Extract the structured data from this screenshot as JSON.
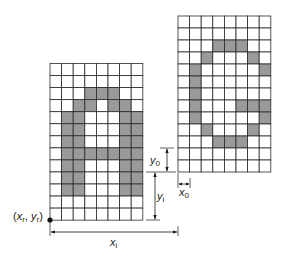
{
  "grid_a": {
    "name": "letter-A-glyph",
    "origin": [
      50,
      63.5
    ],
    "cols": 8,
    "rows": 13,
    "cell_w": 11.6,
    "cell_h": 12.05,
    "filled": [
      [
        2,
        3
      ],
      [
        2,
        4
      ],
      [
        2,
        5
      ],
      [
        3,
        2
      ],
      [
        3,
        3
      ],
      [
        3,
        5
      ],
      [
        3,
        6
      ],
      [
        4,
        1
      ],
      [
        4,
        2
      ],
      [
        4,
        6
      ],
      [
        4,
        7
      ],
      [
        5,
        1
      ],
      [
        5,
        2
      ],
      [
        5,
        6
      ],
      [
        5,
        7
      ],
      [
        6,
        1
      ],
      [
        6,
        2
      ],
      [
        6,
        6
      ],
      [
        6,
        7
      ],
      [
        7,
        1
      ],
      [
        7,
        2
      ],
      [
        7,
        3
      ],
      [
        7,
        4
      ],
      [
        7,
        5
      ],
      [
        7,
        6
      ],
      [
        7,
        7
      ],
      [
        8,
        1
      ],
      [
        8,
        2
      ],
      [
        8,
        6
      ],
      [
        8,
        7
      ],
      [
        9,
        1
      ],
      [
        9,
        2
      ],
      [
        9,
        6
      ],
      [
        9,
        7
      ],
      [
        10,
        1
      ],
      [
        10,
        2
      ],
      [
        10,
        6
      ],
      [
        10,
        7
      ]
    ]
  },
  "grid_g": {
    "name": "letter-G-glyph",
    "origin": [
      178,
      16
    ],
    "cols": 8,
    "rows": 13,
    "cell_w": 11.6,
    "cell_h": 12.0,
    "filled": [
      [
        2,
        3
      ],
      [
        2,
        4
      ],
      [
        2,
        5
      ],
      [
        3,
        2
      ],
      [
        3,
        6
      ],
      [
        4,
        1
      ],
      [
        4,
        7
      ],
      [
        5,
        1
      ],
      [
        6,
        1
      ],
      [
        7,
        1
      ],
      [
        7,
        5
      ],
      [
        7,
        6
      ],
      [
        7,
        7
      ],
      [
        8,
        1
      ],
      [
        8,
        7
      ],
      [
        9,
        2
      ],
      [
        9,
        6
      ],
      [
        10,
        3
      ],
      [
        10,
        4
      ],
      [
        10,
        5
      ]
    ]
  },
  "labels": {
    "reference_point": {
      "x": "x",
      "x_sub": "r",
      "sep": ", ",
      "y": "y",
      "y_sub": "r"
    },
    "y0": {
      "main": "y",
      "sub": "0"
    },
    "x0": {
      "main": "x",
      "sub": "0"
    },
    "yi": {
      "main": "y",
      "sub": "i"
    },
    "xi": {
      "main": "x",
      "sub": "i"
    }
  },
  "colors": {
    "filled_cell": "#9a9a9a",
    "grid_line": "#2a2a2a",
    "background": "#ffffff"
  }
}
